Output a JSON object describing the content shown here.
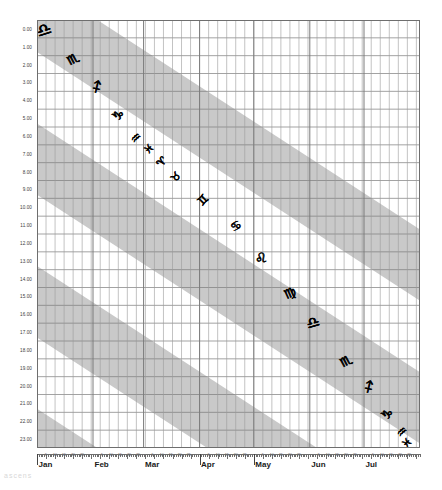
{
  "chart_data": {
    "type": "line",
    "title": "",
    "subtitle": "",
    "xlabel": "",
    "ylabel": "",
    "grid": true,
    "legend": "none",
    "x_axis": {
      "type": "date",
      "months": [
        "Jan",
        "Feb",
        "Mar",
        "Apr",
        "May",
        "Jun",
        "Jul"
      ],
      "month_start_days": [
        0,
        31,
        59,
        90,
        120,
        151,
        181
      ],
      "total_days": 212,
      "day_tick_labels": [
        "5",
        "10",
        "15",
        "20",
        "25"
      ],
      "day_tick_offsets": [
        5,
        10,
        15,
        20,
        25
      ],
      "range": [
        0,
        212
      ]
    },
    "y_axis": {
      "label_suffix": ".00",
      "ticks": [
        "0.00",
        "1.00",
        "2.00",
        "3.00",
        "4.00",
        "5.00",
        "6.00",
        "7.00",
        "8.00",
        "9.00",
        "10.00",
        "11.00",
        "12.00",
        "13.00",
        "14.00",
        "15.00",
        "16.00",
        "17.00",
        "18.00",
        "19.00",
        "20.00",
        "21.00",
        "22.00",
        "23.00"
      ],
      "range": [
        0,
        24
      ],
      "direction": "down"
    },
    "bands": {
      "shaded_color": "#c9c9c9",
      "unshaded_color": "#ffffff",
      "description": "Alternating diagonal bands of ascendant sign ranges",
      "slope_days_per_hour": 15.2,
      "band_width_hours": 4,
      "period_hours": 8,
      "offsets_hours": [
        -2.2,
        5.8,
        13.8,
        21.8,
        29.8,
        37.8
      ]
    },
    "zodiac_glyphs": [
      {
        "sign": "Libra",
        "symbol": "♎",
        "x_day": 4,
        "y_hour": 0.55,
        "size": 17,
        "rotate": -18
      },
      {
        "sign": "Scorpio",
        "symbol": "♏",
        "x_day": 20,
        "y_hour": 2.2,
        "size": 13,
        "rotate": -28
      },
      {
        "sign": "Sagittarius",
        "symbol": "♐",
        "x_day": 33,
        "y_hour": 3.75,
        "size": 13,
        "rotate": -32
      },
      {
        "sign": "Capricorn",
        "symbol": "♑",
        "x_day": 45,
        "y_hour": 5.35,
        "size": 13,
        "rotate": -38
      },
      {
        "sign": "Aquarius",
        "symbol": "♒",
        "x_day": 55,
        "y_hour": 6.6,
        "size": 12,
        "rotate": -42
      },
      {
        "sign": "Pisces",
        "symbol": "♓",
        "x_day": 62,
        "y_hour": 7.25,
        "size": 11,
        "rotate": -45
      },
      {
        "sign": "Aries",
        "symbol": "♈",
        "x_day": 69,
        "y_hour": 7.95,
        "size": 11,
        "rotate": -48
      },
      {
        "sign": "Taurus",
        "symbol": "♉",
        "x_day": 77,
        "y_hour": 8.8,
        "size": 11,
        "rotate": -50
      },
      {
        "sign": "Gemini",
        "symbol": "♊",
        "x_day": 92,
        "y_hour": 10.1,
        "size": 12,
        "rotate": -45
      },
      {
        "sign": "Cancer",
        "symbol": "♋",
        "x_day": 110,
        "y_hour": 11.55,
        "size": 12,
        "rotate": -30
      },
      {
        "sign": "Leo",
        "symbol": "♌",
        "x_day": 124,
        "y_hour": 13.35,
        "size": 14,
        "rotate": -14
      },
      {
        "sign": "Virgo",
        "symbol": "♍",
        "x_day": 140,
        "y_hour": 15.3,
        "size": 13,
        "rotate": -24
      },
      {
        "sign": "Libra",
        "symbol": "♎",
        "x_day": 153,
        "y_hour": 17.0,
        "size": 15,
        "rotate": -16
      },
      {
        "sign": "Scorpio",
        "symbol": "♏",
        "x_day": 171,
        "y_hour": 19.1,
        "size": 13,
        "rotate": -28
      },
      {
        "sign": "Sagittarius",
        "symbol": "♐",
        "x_day": 184,
        "y_hour": 20.6,
        "size": 13,
        "rotate": -32
      },
      {
        "sign": "Capricorn",
        "symbol": "♑",
        "x_day": 194,
        "y_hour": 22.1,
        "size": 13,
        "rotate": -38
      },
      {
        "sign": "Aquarius",
        "symbol": "♒",
        "x_day": 202,
        "y_hour": 23.1,
        "size": 12,
        "rotate": -42
      },
      {
        "sign": "Pisces",
        "symbol": "♓",
        "x_day": 205,
        "y_hour": 23.7,
        "size": 11,
        "rotate": -45
      }
    ],
    "top_right_glyphs": [
      {
        "sign": "Aries",
        "symbol": "♈",
        "x_day": 207,
        "y_hour": 24.3,
        "size": 10,
        "rotate": -48
      },
      {
        "sign": "Taurus",
        "symbol": "♉",
        "x_day": 210,
        "y_hour": 24.9,
        "size": 10,
        "rotate": -50
      }
    ],
    "colors": {
      "band_shaded": "#c9c9c9",
      "grid_line": "#7b7b7b",
      "grid_line_minor": "#9a9a9a",
      "axis": "#6e6e6e",
      "text": "#1a1a1a",
      "background": "#ffffff"
    }
  },
  "footer": {
    "watermark": "ascens"
  }
}
